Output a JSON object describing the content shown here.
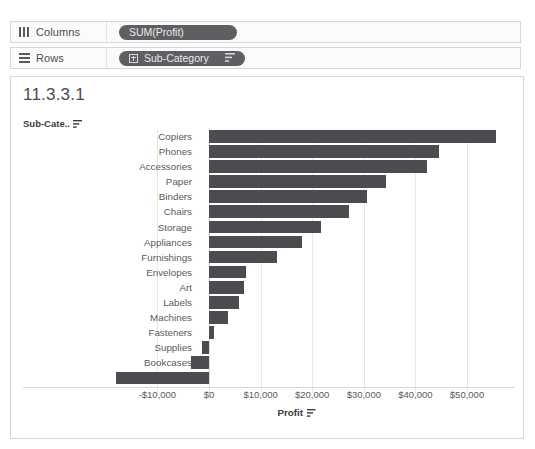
{
  "top_strip": {
    "text": ""
  },
  "shelves": {
    "columns": {
      "label": "Columns",
      "icon": "columns-icon",
      "pill": {
        "text": "SUM(Profit)"
      }
    },
    "rows": {
      "label": "Rows",
      "icon": "rows-icon",
      "pill": {
        "text": "Sub-Category",
        "has_expand": true,
        "has_sort": true
      }
    }
  },
  "viz": {
    "title": "11.3.3.1",
    "row_header": "Sub-Cate..",
    "row_header_sort_icon": "sort-descending-icon"
  },
  "colors": {
    "bar": "#4c4c50",
    "pill": "#5f5f63",
    "gridline": "#e8e8ea",
    "text": "#5a5a5a"
  },
  "chart_data": {
    "type": "bar",
    "orientation": "horizontal",
    "title": "11.3.3.1",
    "xlabel": "Profit",
    "ylabel": "Sub-Cate..",
    "xlim": [
      -18000,
      57500
    ],
    "xticks": [
      -10000,
      0,
      10000,
      20000,
      30000,
      40000,
      50000
    ],
    "xticklabels": [
      "-$10,000",
      "$0",
      "$10,000",
      "$20,000",
      "$30,000",
      "$40,000",
      "$50,000"
    ],
    "grid": true,
    "legend": false,
    "categories": [
      "Copiers",
      "Phones",
      "Accessories",
      "Paper",
      "Binders",
      "Chairs",
      "Storage",
      "Appliances",
      "Furnishings",
      "Envelopes",
      "Art",
      "Labels",
      "Machines",
      "Fasteners",
      "Supplies",
      "Bookcases",
      "Tables"
    ],
    "values": [
      55600,
      44600,
      42200,
      34300,
      30600,
      27100,
      21700,
      18000,
      13200,
      7200,
      6800,
      5800,
      3700,
      950,
      -1400,
      -3500,
      -18000
    ]
  }
}
